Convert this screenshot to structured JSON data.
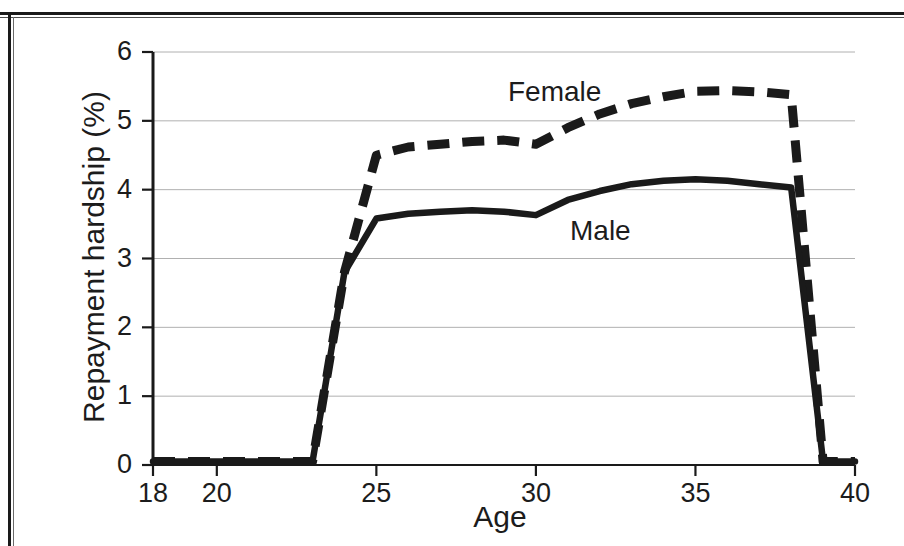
{
  "figure": {
    "background_color": "#ffffff",
    "ink_color": "#1a1a1a",
    "gridline_color": "#b0b0b0"
  },
  "chart_data": {
    "type": "line",
    "title": "",
    "subtitle": "",
    "xlabel": "Age",
    "ylabel": "Repayment hardship (%)",
    "xlim": [
      18,
      40
    ],
    "ylim": [
      0,
      6
    ],
    "xticks": [
      18,
      20,
      25,
      30,
      35,
      40
    ],
    "xtick_labels": [
      "18",
      "20",
      "25",
      "30",
      "35",
      "40"
    ],
    "yticks": [
      0,
      1,
      2,
      3,
      4,
      5,
      6
    ],
    "ytick_labels": [
      "0",
      "1",
      "2",
      "3",
      "4",
      "5",
      "6"
    ],
    "grid": "horizontal",
    "legend_position": "inline-annotations",
    "annotations": [
      {
        "text": "Female",
        "x": 28.2,
        "y": 5.45
      },
      {
        "text": "Male",
        "x": 32.1,
        "y": 3.35
      }
    ],
    "series": [
      {
        "name": "Female",
        "style": "dashed",
        "color": "#1a1a1a",
        "x": [
          18,
          19,
          20,
          21,
          22,
          23,
          24,
          25,
          26,
          27,
          28,
          29,
          30,
          31,
          32,
          33,
          34,
          35,
          36,
          37,
          38,
          39,
          40
        ],
        "values": [
          0.05,
          0.05,
          0.05,
          0.05,
          0.05,
          0.05,
          2.8,
          4.5,
          4.62,
          4.66,
          4.7,
          4.72,
          4.66,
          4.9,
          5.1,
          5.25,
          5.35,
          5.43,
          5.44,
          5.42,
          5.38,
          0.05,
          0.05
        ]
      },
      {
        "name": "Male",
        "style": "solid",
        "color": "#1a1a1a",
        "x": [
          18,
          19,
          20,
          21,
          22,
          23,
          24,
          25,
          26,
          27,
          28,
          29,
          30,
          31,
          32,
          33,
          34,
          35,
          36,
          37,
          38,
          39,
          40
        ],
        "values": [
          0.05,
          0.05,
          0.05,
          0.05,
          0.05,
          0.05,
          2.8,
          3.58,
          3.65,
          3.68,
          3.7,
          3.68,
          3.63,
          3.85,
          3.98,
          4.08,
          4.13,
          4.15,
          4.13,
          4.08,
          4.03,
          0.05,
          0.05
        ]
      }
    ]
  },
  "axes": {
    "y_title": "Repayment hardship (%)",
    "x_title": "Age"
  }
}
